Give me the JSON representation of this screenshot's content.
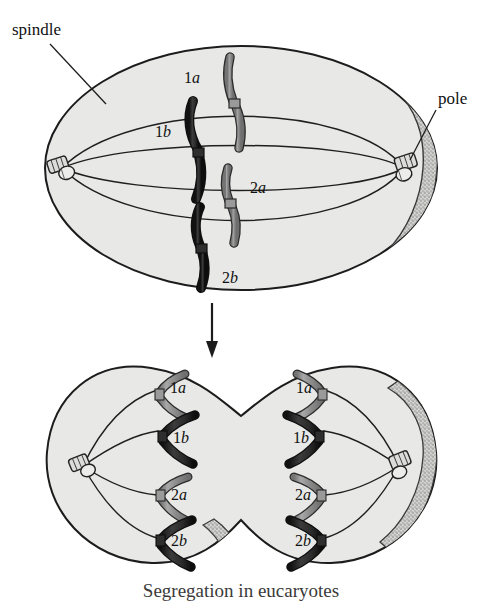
{
  "figure": {
    "caption": "Segregation in eucaryotes",
    "annotations": {
      "spindle_label": "spindle",
      "pole_label": "pole"
    },
    "colors": {
      "cytoplasm": "#e8e8e6",
      "outline": "#1c1c1c",
      "chromosome_dark": "#2b2b2b",
      "chromosome_light": "#8c8c8c",
      "membrane_stipple": "#9a9a9a",
      "background": "#ffffff",
      "caption": "#3a3a3a"
    },
    "panels": [
      {
        "id": "metaphase-cell",
        "name": "upper-cell",
        "stage": "metaphase",
        "poles": 2,
        "spindle_fibers": 4,
        "chromosomes": [
          {
            "label_number": "1",
            "label_letter": "a",
            "shade": "light"
          },
          {
            "label_number": "1",
            "label_letter": "b",
            "shade": "dark"
          },
          {
            "label_number": "2",
            "label_letter": "a",
            "shade": "light"
          },
          {
            "label_number": "2",
            "label_letter": "b",
            "shade": "dark"
          }
        ]
      },
      {
        "id": "anaphase-cell",
        "name": "lower-cell",
        "stage": "anaphase",
        "poles": 2,
        "daughters": [
          {
            "side": "left",
            "chromosomes": [
              {
                "label_number": "1",
                "label_letter": "a",
                "shade": "light"
              },
              {
                "label_number": "1",
                "label_letter": "b",
                "shade": "dark"
              },
              {
                "label_number": "2",
                "label_letter": "a",
                "shade": "light"
              },
              {
                "label_number": "2",
                "label_letter": "b",
                "shade": "dark"
              }
            ]
          },
          {
            "side": "right",
            "chromosomes": [
              {
                "label_number": "1",
                "label_letter": "a",
                "shade": "light"
              },
              {
                "label_number": "1",
                "label_letter": "b",
                "shade": "dark"
              },
              {
                "label_number": "2",
                "label_letter": "a",
                "shade": "light"
              },
              {
                "label_number": "2",
                "label_letter": "b",
                "shade": "dark"
              }
            ]
          }
        ]
      }
    ],
    "transition_arrow": {
      "direction": "down"
    }
  }
}
